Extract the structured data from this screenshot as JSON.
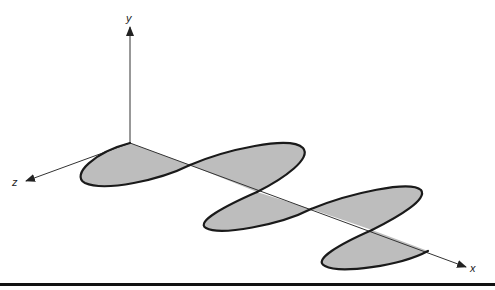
{
  "figure": {
    "type": "3D sinusoidal wave propagation along x-axis (oscillating in z)",
    "axes": {
      "x": {
        "label": "x"
      },
      "y": {
        "label": "y"
      },
      "z": {
        "label": "z"
      }
    },
    "colors": {
      "fill": "#bdbdbd",
      "stroke": "#1a1a1a",
      "axis": "#333333",
      "rule": "#111111"
    },
    "lobes": 5
  }
}
